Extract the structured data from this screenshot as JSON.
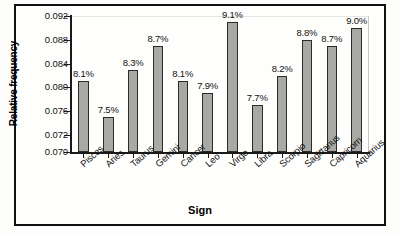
{
  "chart_data": {
    "type": "bar",
    "title": "",
    "xlabel": "Sign",
    "ylabel": "Relative frequency",
    "categories": [
      "Pisces",
      "Aries",
      "Taurus",
      "Gemini",
      "Cancer",
      "Leo",
      "Virgo",
      "Libra",
      "Scorpio",
      "Sagittarius",
      "Capricorn",
      "Aquarius"
    ],
    "values": [
      0.081,
      0.075,
      0.083,
      0.087,
      0.081,
      0.079,
      0.091,
      0.077,
      0.082,
      0.088,
      0.087,
      0.09
    ],
    "data_labels": [
      "8.1%",
      "7.5%",
      "8.3%",
      "8.7%",
      "8.1%",
      "7.9%",
      "9.1%",
      "7.7%",
      "8.2%",
      "8.8%",
      "8.7%",
      "9.0%"
    ],
    "ytick_labels": [
      "0.092",
      "0.088",
      "0.084",
      "0.080",
      "0.076",
      "0.072",
      "0.070"
    ],
    "ytick_values": [
      0.092,
      0.088,
      0.084,
      0.08,
      0.076,
      0.072,
      0.07
    ],
    "ylim": [
      0.07,
      0.0928
    ],
    "axis_break": true,
    "grid": false,
    "legend": null,
    "bar_color": "#a8a8a4",
    "bar_edge_color": "#2b2b2b"
  }
}
